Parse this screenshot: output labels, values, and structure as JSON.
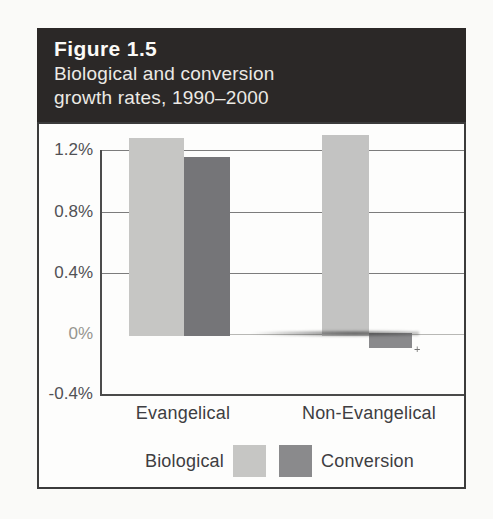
{
  "figure": {
    "label": "Figure 1.5",
    "title_line1": "Biological and conversion",
    "title_line2": "growth rates, 1990–2000"
  },
  "chart_data": {
    "type": "bar",
    "categories": [
      "Evangelical",
      "Non-Evangelical"
    ],
    "series": [
      {
        "name": "Biological",
        "values": [
          1.28,
          1.3
        ],
        "color": "#c6c6c4",
        "bar_colors": [
          "#c6c6c4",
          "#c3c3c2"
        ]
      },
      {
        "name": "Conversion",
        "values": [
          1.16,
          -0.09
        ],
        "color": "#7b7b7e",
        "bar_colors": [
          "#757578",
          "#8a8a8c"
        ]
      }
    ],
    "title": "Biological and conversion growth rates, 1990–2000",
    "xlabel": "",
    "ylabel": "",
    "y_ticks": [
      "1.2%",
      "0.8%",
      "0.4%",
      "0%",
      "-0.4%"
    ],
    "y_tick_values": [
      1.2,
      0.8,
      0.4,
      0.0,
      -0.4
    ],
    "ylim": [
      -0.4,
      1.4
    ],
    "grid": true,
    "legend_position": "bottom"
  },
  "artifact_glyph": "+",
  "colors": {
    "background": "#fafaf8",
    "header_bg": "#2b2827",
    "header_text": "#efeeea",
    "box_border": "#3b3b3b",
    "grid": "#7c7c7c",
    "axis": "#4c4c4c",
    "tick_text": "#515155",
    "biological": "#c6c6c4",
    "conversion": "#757578",
    "conversion_legend": "#8a8a8c"
  }
}
